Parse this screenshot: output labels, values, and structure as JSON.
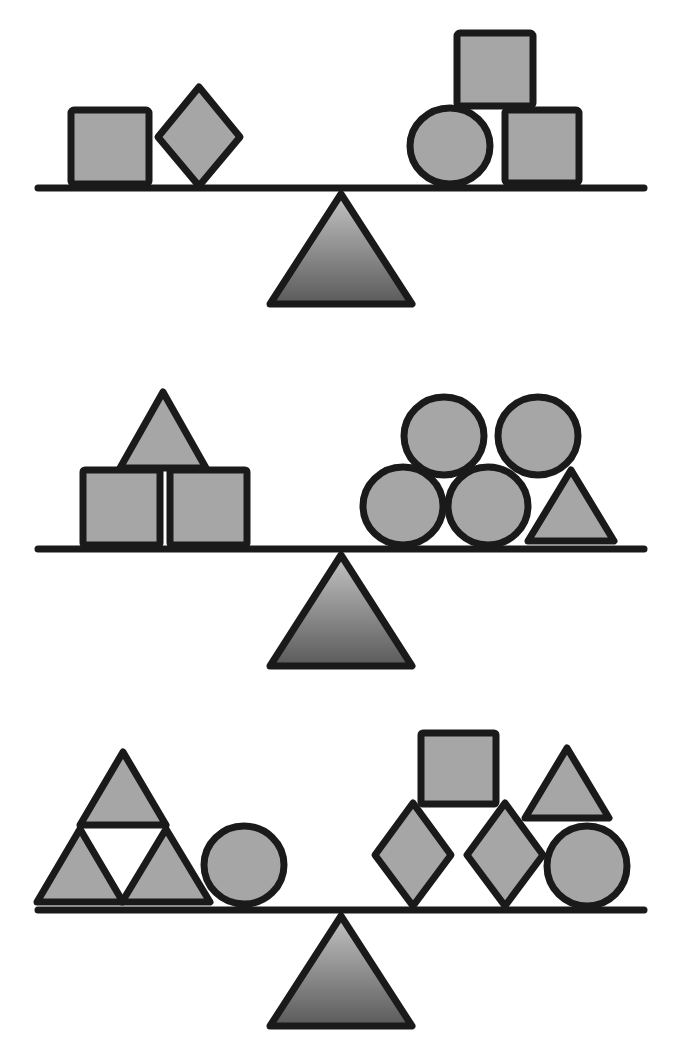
{
  "colors": {
    "shape_fill": "#a6a6a6",
    "outline": "#1a1a1a",
    "fulcrum_gradient_top": "#c4c4c4",
    "fulcrum_gradient_bottom": "#5a5a5a",
    "background": "#ffffff"
  },
  "scales": [
    {
      "id": "scale-1",
      "state": "balanced",
      "left_pan": [
        "square",
        "diamond"
      ],
      "right_pan": [
        "circle",
        "square",
        "square"
      ]
    },
    {
      "id": "scale-2",
      "state": "balanced",
      "left_pan": [
        "square",
        "square",
        "triangle"
      ],
      "right_pan": [
        "circle",
        "circle",
        "circle",
        "circle",
        "triangle"
      ]
    },
    {
      "id": "scale-3",
      "state": "balanced",
      "left_pan": [
        "triangle",
        "triangle",
        "triangle",
        "circle"
      ],
      "right_pan": [
        "diamond",
        "diamond",
        "square",
        "triangle",
        "circle"
      ]
    }
  ]
}
